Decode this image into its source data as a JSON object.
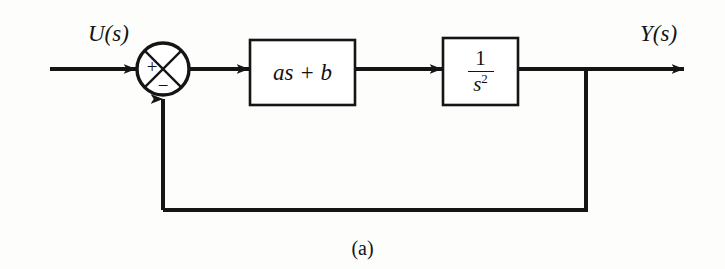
{
  "figure": {
    "caption": "(a)",
    "kind": "control-system-block-diagram",
    "background_color": "#fdfdfc",
    "line_color": "#151515"
  },
  "signals": {
    "input_label": "U(s)",
    "output_label": "Y(s)"
  },
  "summing_junction": {
    "name": "summing-junction",
    "shape": "circle-with-diagonal-cross",
    "plus_sign": "+",
    "minus_sign": "−",
    "plus_input": "U(s)",
    "minus_input": "feedback"
  },
  "blocks": [
    {
      "id": "block-1",
      "label": "as + b",
      "type": "transfer-function",
      "shape": "rectangle"
    },
    {
      "id": "block-2",
      "label": "1/s^2",
      "numerator": "1",
      "denominator_base": "s",
      "denominator_exponent": "2",
      "type": "transfer-function",
      "shape": "rectangle"
    }
  ],
  "connections": [
    {
      "id": "input-arrow",
      "from": "U(s)",
      "to": "summing-junction",
      "arrow": true
    },
    {
      "id": "error-arrow",
      "from": "summing-junction",
      "to": "block-1",
      "arrow": true
    },
    {
      "id": "interblock-arrow",
      "from": "block-1",
      "to": "block-2",
      "arrow": true
    },
    {
      "id": "output-arrow",
      "from": "block-2",
      "to": "Y(s)",
      "arrow": true
    },
    {
      "id": "feedback-path",
      "from": "output-takeoff",
      "to": "summing-junction",
      "arrow": true
    }
  ]
}
